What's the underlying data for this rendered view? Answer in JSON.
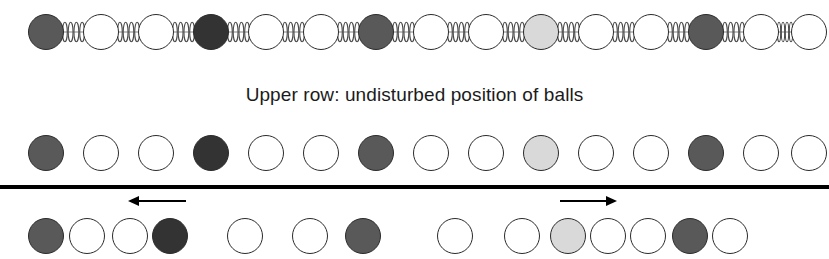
{
  "figure": {
    "width": 829,
    "height": 259,
    "background": "#ffffff"
  },
  "caption": {
    "text": "Upper row: undisturbed position of balls",
    "x_center": 415,
    "y": 96,
    "font_size": 19,
    "color": "#1b1b1b"
  },
  "palette": {
    "white": "#ffffff",
    "light_gray": "#d9d9d9",
    "mid_gray": "#595959",
    "dark_gray": "#333333",
    "outline": "#2b2b2b",
    "line": "#000000",
    "spring": "#4a4a4a"
  },
  "ball_diameter": 36,
  "divider": {
    "y": 185,
    "height": 4,
    "color": "#000000"
  },
  "rows": [
    {
      "name": "spring-chain-row",
      "label": "Chain of balls connected by springs",
      "y_center": 32,
      "ball_diameter": 36,
      "has_springs": true,
      "balls": [
        {
          "cx": 46,
          "fill": "mid_gray"
        },
        {
          "cx": 101,
          "fill": "white"
        },
        {
          "cx": 156,
          "fill": "white"
        },
        {
          "cx": 211,
          "fill": "dark_gray"
        },
        {
          "cx": 266,
          "fill": "white"
        },
        {
          "cx": 321,
          "fill": "white"
        },
        {
          "cx": 376,
          "fill": "mid_gray"
        },
        {
          "cx": 431,
          "fill": "white"
        },
        {
          "cx": 486,
          "fill": "white"
        },
        {
          "cx": 541,
          "fill": "light_gray"
        },
        {
          "cx": 596,
          "fill": "white"
        },
        {
          "cx": 651,
          "fill": "white"
        },
        {
          "cx": 706,
          "fill": "mid_gray"
        },
        {
          "cx": 761,
          "fill": "white"
        },
        {
          "cx": 809,
          "fill": "white"
        }
      ]
    },
    {
      "name": "undisturbed-row",
      "label": "Upper row: undisturbed position of balls",
      "y_center": 153,
      "ball_diameter": 36,
      "has_springs": false,
      "balls": [
        {
          "cx": 46,
          "fill": "mid_gray"
        },
        {
          "cx": 101,
          "fill": "white"
        },
        {
          "cx": 156,
          "fill": "white"
        },
        {
          "cx": 211,
          "fill": "dark_gray"
        },
        {
          "cx": 266,
          "fill": "white"
        },
        {
          "cx": 321,
          "fill": "white"
        },
        {
          "cx": 376,
          "fill": "mid_gray"
        },
        {
          "cx": 431,
          "fill": "white"
        },
        {
          "cx": 486,
          "fill": "white"
        },
        {
          "cx": 541,
          "fill": "light_gray"
        },
        {
          "cx": 596,
          "fill": "white"
        },
        {
          "cx": 651,
          "fill": "white"
        },
        {
          "cx": 706,
          "fill": "mid_gray"
        },
        {
          "cx": 761,
          "fill": "white"
        },
        {
          "cx": 809,
          "fill": "white"
        }
      ]
    },
    {
      "name": "disturbed-row",
      "label": "Lower row: displaced balls showing compression and rarefaction",
      "y_center": 236,
      "ball_diameter": 36,
      "has_springs": false,
      "balls": [
        {
          "cx": 46,
          "fill": "mid_gray"
        },
        {
          "cx": 87,
          "fill": "white"
        },
        {
          "cx": 130,
          "fill": "white"
        },
        {
          "cx": 170,
          "fill": "dark_gray"
        },
        {
          "cx": 245,
          "fill": "white"
        },
        {
          "cx": 310,
          "fill": "white"
        },
        {
          "cx": 363,
          "fill": "mid_gray"
        },
        {
          "cx": 455,
          "fill": "white"
        },
        {
          "cx": 522,
          "fill": "white"
        },
        {
          "cx": 568,
          "fill": "light_gray"
        },
        {
          "cx": 608,
          "fill": "white"
        },
        {
          "cx": 648,
          "fill": "white"
        },
        {
          "cx": 690,
          "fill": "mid_gray"
        },
        {
          "cx": 730,
          "fill": "white"
        }
      ]
    }
  ],
  "arrows": [
    {
      "name": "displacement-arrow-left",
      "direction": "left",
      "x_start": 128,
      "x_end": 186,
      "y": 201,
      "color": "#000000"
    },
    {
      "name": "displacement-arrow-right",
      "direction": "right",
      "x_start": 560,
      "x_end": 617,
      "y": 201,
      "color": "#000000"
    }
  ]
}
